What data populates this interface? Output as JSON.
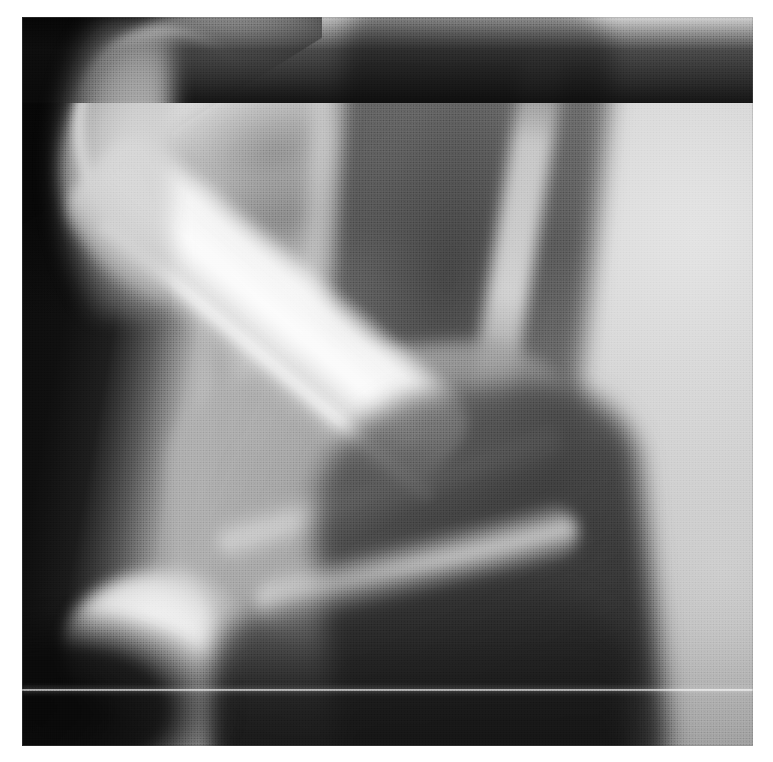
{
  "document": {
    "type": "radiograph",
    "modality": "X-ray",
    "view": "lateral",
    "body_part": "elbow",
    "caption": "",
    "visible_text": []
  },
  "canvas": {
    "width_px": 773,
    "height_px": 762,
    "background_color": "#ffffff"
  },
  "plate": {
    "left_px": 22,
    "top_px": 17,
    "width_px": 731,
    "height_px": 729,
    "film_base_color": "#0b0b0b",
    "description": "Scanned halftone lateral elbow radiograph"
  },
  "palette": {
    "paper_white": "#ffffff",
    "film_black": "#060606",
    "bone_bright": "#f6f6f6",
    "bone_mid": "#d6d6d6",
    "soft_tissue": "#9d9d9d",
    "dark_tissue": "#4a4a4a",
    "air_black": "#0b0b0b",
    "scanline_white": "#ffffff"
  },
  "features": [
    {
      "name": "collimation-corner",
      "label": "Collimation shutter corner",
      "position": "top-left",
      "tone": "black"
    },
    {
      "name": "air-column-left",
      "label": "Air / background column",
      "position": "left edge",
      "tone": "black"
    },
    {
      "name": "distal-humerus",
      "label": "Distal humerus / trochlea",
      "position": "upper-left",
      "tone": "bright"
    },
    {
      "name": "olecranon-process",
      "label": "Olecranon process of ulna",
      "position": "left-diagonal",
      "tone": "bright"
    },
    {
      "name": "olecranon-tip",
      "label": "Olecranon tip",
      "position": "lower-left",
      "tone": "bright"
    },
    {
      "name": "ulna-shaft",
      "label": "Ulna shaft",
      "position": "center-diagonal",
      "tone": "mid-grey"
    },
    {
      "name": "radius-humeral-shaft",
      "label": "Overlying shaft / soft tissue band",
      "position": "center-right",
      "tone": "dark"
    },
    {
      "name": "coronoid-streak",
      "label": "Coronoid / cortical streak",
      "position": "lower-center",
      "tone": "bright"
    },
    {
      "name": "soft-tissue-right",
      "label": "Soft tissue field",
      "position": "right",
      "tone": "light-grey"
    },
    {
      "name": "scanline-artifact",
      "label": "Horizontal white scan artifact",
      "position": "y≈690",
      "tone": "white"
    },
    {
      "name": "halftone-screen",
      "label": "Printed halftone dot screen",
      "position": "full plate",
      "tone": "texture"
    }
  ]
}
